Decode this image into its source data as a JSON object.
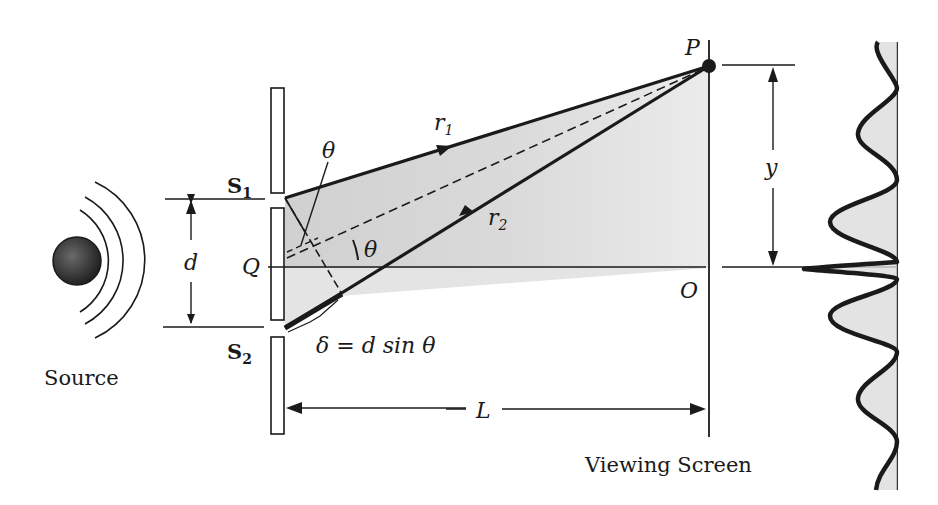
{
  "diagram": {
    "labels": {
      "source": "Source",
      "slit1": "S",
      "slit1_sub": "1",
      "slit2": "S",
      "slit2_sub": "2",
      "slit_separation": "d",
      "midpoint": "Q",
      "point_on_screen": "P",
      "screen_center": "O",
      "ray1": "r",
      "ray1_sub": "1",
      "ray2": "r",
      "ray2_sub": "2",
      "angle_top": "θ",
      "angle_center": "θ",
      "path_difference": "δ = d sin θ",
      "screen_distance": "L",
      "height": "y",
      "viewing_screen": "Viewing Screen"
    },
    "colors": {
      "ink": "#1a1a1a",
      "shade": "#cfcfcf",
      "shade_light": "#e6e6e6",
      "source_fill": "#3a3a3a"
    }
  }
}
